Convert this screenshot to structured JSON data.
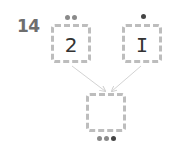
{
  "question_number": "14",
  "boxes": [
    {
      "id": "left",
      "value": "2",
      "dots": 2
    },
    {
      "id": "right",
      "value": "I",
      "dots": 1
    },
    {
      "id": "result",
      "value": "",
      "dots": 3
    }
  ],
  "colors": {
    "box_border": "#bdbdbd",
    "dot_light": "#8a8a8a",
    "dot_dark": "#444444",
    "arrow": "#cfcfcf",
    "number": "#6e6e6e"
  }
}
